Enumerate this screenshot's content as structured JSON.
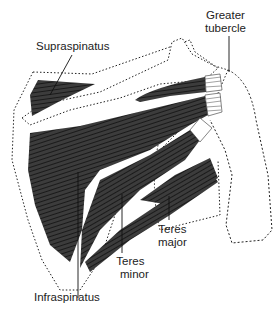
{
  "diagram": {
    "labels": {
      "greater_tubercle_line1": "Greater",
      "greater_tubercle_line2": "tubercle",
      "supraspinatus": "Supraspinatus",
      "teres_major_line1": "Teres",
      "teres_major_line2": "major",
      "teres_minor_line1": "Teres",
      "teres_minor_line2": "minor",
      "infraspinatus": "Infraspinatus"
    },
    "colors": {
      "muscle": "#3a3a3a",
      "fiber": "#111111",
      "outline": "#222222",
      "background": "#ffffff"
    }
  }
}
